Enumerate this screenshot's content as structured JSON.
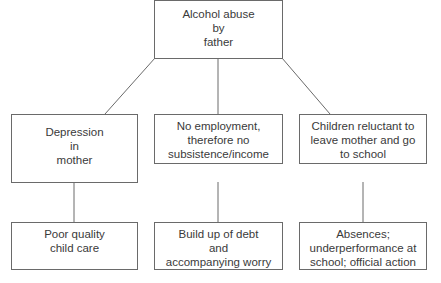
{
  "diagram": {
    "type": "tree",
    "root": {
      "id": "root",
      "label": "Alcohol abuse\nby\nfather"
    },
    "level1": [
      {
        "id": "depression",
        "label": "Depression\nin\nmother"
      },
      {
        "id": "employment",
        "label": "No employment,\ntherefore no\nsubsistence/income"
      },
      {
        "id": "children",
        "label": "Children reluctant to\nleave mother and go\nto school"
      }
    ],
    "level2": [
      {
        "id": "childcare",
        "parent": "depression",
        "label": "Poor quality\nchild care"
      },
      {
        "id": "debt",
        "parent": "employment",
        "label": "Build up of debt\nand\naccompanying worry"
      },
      {
        "id": "absences",
        "parent": "children",
        "label": "Absences;\nunderperformance at\nschool; official action"
      }
    ],
    "colors": {
      "line": "#6a6a6a",
      "text": "#3a3a3a",
      "background": "#ffffff"
    }
  }
}
